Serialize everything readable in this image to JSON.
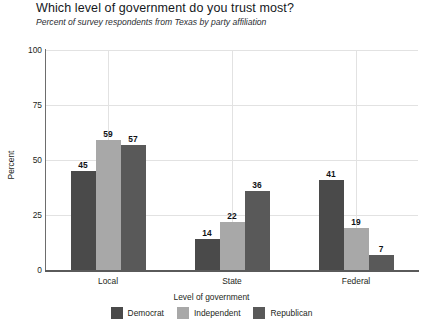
{
  "chart_data": {
    "type": "bar",
    "title": "Which level of government do you trust most?",
    "subtitle": "Percent of survey respondents from Texas by party affiliation",
    "xlabel": "Level of government",
    "ylabel": "Percent",
    "categories": [
      "Local",
      "State",
      "Federal"
    ],
    "series": [
      {
        "name": "Democrat",
        "color": "#4a4a4a",
        "values": [
          45,
          14,
          41
        ]
      },
      {
        "name": "Independent",
        "color": "#a8a8a8",
        "values": [
          59,
          22,
          19
        ]
      },
      {
        "name": "Republican",
        "color": "#595959",
        "values": [
          57,
          36,
          7
        ]
      }
    ],
    "ylim": [
      0,
      100
    ],
    "yticks": [
      0,
      25,
      50,
      75,
      100
    ],
    "ytick_labels": [
      "0",
      "25",
      "50",
      "75",
      "100"
    ],
    "grid": true,
    "legend_position": "bottom"
  },
  "legend": {
    "items": [
      {
        "label": "Democrat",
        "color": "#4a4a4a"
      },
      {
        "label": "Independent",
        "color": "#a8a8a8"
      },
      {
        "label": "Republican",
        "color": "#595959"
      }
    ]
  }
}
